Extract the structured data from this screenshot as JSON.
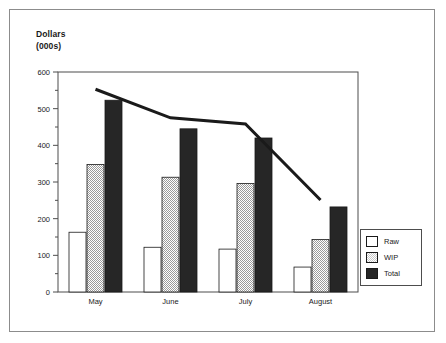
{
  "chart_data": {
    "type": "bar",
    "title": "Dollars (000s)",
    "title_lines": [
      "Dollars",
      "(000s)"
    ],
    "xlabel": "",
    "ylabel": "Dollars (000s)",
    "categories": [
      "May",
      "June",
      "July",
      "August"
    ],
    "ylim": [
      0,
      600
    ],
    "ytick_values": [
      0,
      100,
      200,
      300,
      400,
      500,
      600
    ],
    "ytick_labels": [
      "0",
      "100",
      "200",
      "300",
      "400",
      "500",
      "600"
    ],
    "yminor_step": 50,
    "grid": false,
    "legend_position": "right",
    "series": [
      {
        "name": "Raw",
        "type": "bar",
        "color": "#ffffff",
        "values": [
          163,
          122,
          117,
          68
        ]
      },
      {
        "name": "WIP",
        "type": "bar",
        "color": "#cacaca",
        "values": [
          348,
          313,
          296,
          143
        ]
      },
      {
        "name": "Total",
        "type": "bar",
        "color": "#262626",
        "values": [
          523,
          445,
          420,
          232
        ]
      },
      {
        "name": "Trend",
        "type": "line",
        "color": "#1a1a1a",
        "values": [
          553,
          475,
          458,
          251
        ]
      }
    ]
  },
  "legend": {
    "items": [
      {
        "label": "Raw",
        "swatch": "raw"
      },
      {
        "label": "WIP",
        "swatch": "wip"
      },
      {
        "label": "Total",
        "swatch": "total"
      }
    ]
  },
  "colors": {
    "raw": "#ffffff",
    "wip": "#cacaca",
    "total": "#262626",
    "line": "#1a1a1a",
    "axis": "#4d4d4d",
    "frame": "#8c8c8c"
  }
}
